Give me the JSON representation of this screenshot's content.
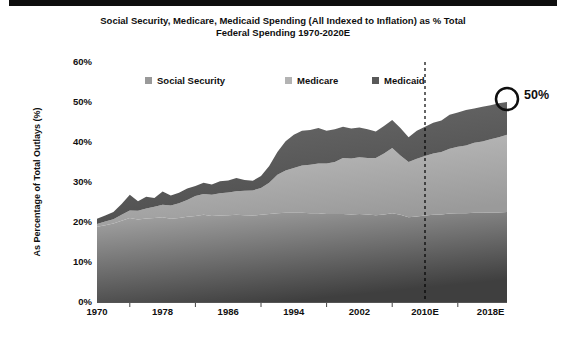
{
  "slide": {
    "title_line1": "Social Security, Medicare, Medicaid Spending (All Indexed to Inflation) as % Total",
    "title_line2": "Federal Spending 1970-2020E"
  },
  "chart_data": {
    "type": "area",
    "stacked": true,
    "title": "Social Security, Medicare, Medicaid Spending (All Indexed to Inflation) as % Total Federal Spending 1970-2020E",
    "xlabel": "",
    "ylabel": "As Percentage of Total Outlays (%)",
    "ylim": [
      0,
      60
    ],
    "grid": false,
    "legend_position": "top",
    "y_ticks": [
      {
        "label": "0%",
        "value": 0
      },
      {
        "label": "10%",
        "value": 10
      },
      {
        "label": "20%",
        "value": 20
      },
      {
        "label": "30%",
        "value": 30
      },
      {
        "label": "40%",
        "value": 40
      },
      {
        "label": "50%",
        "value": 50
      },
      {
        "label": "60%",
        "value": 60
      }
    ],
    "x_ticks": [
      {
        "label": "1970",
        "year": 1970
      },
      {
        "label": "1978",
        "year": 1978
      },
      {
        "label": "1986",
        "year": 1986
      },
      {
        "label": "1994",
        "year": 1994
      },
      {
        "label": "2002",
        "year": 2002
      },
      {
        "label": "2010E",
        "year": 2010
      },
      {
        "label": "2018E",
        "year": 2018
      }
    ],
    "minor_tick_years": [
      1974,
      1982,
      1990,
      1998,
      2006,
      2014
    ],
    "dashed_line_year": 2010,
    "annotation": {
      "label": "50%",
      "year": 2020,
      "value": 50
    },
    "years": [
      1970,
      1971,
      1972,
      1973,
      1974,
      1975,
      1976,
      1977,
      1978,
      1979,
      1980,
      1981,
      1982,
      1983,
      1984,
      1985,
      1986,
      1987,
      1988,
      1989,
      1990,
      1991,
      1992,
      1993,
      1994,
      1995,
      1996,
      1997,
      1998,
      1999,
      2000,
      2001,
      2002,
      2003,
      2004,
      2005,
      2006,
      2007,
      2008,
      2009,
      2010,
      2011,
      2012,
      2013,
      2014,
      2015,
      2016,
      2017,
      2018,
      2019,
      2020
    ],
    "series": [
      {
        "name": "Social Security",
        "legend_color": "#999999",
        "fill_from": "#a8a8a8",
        "fill_to": "#3f3f3f",
        "values": [
          18.8,
          19.2,
          19.6,
          20.3,
          21.0,
          20.6,
          20.9,
          21.0,
          21.2,
          20.8,
          21.0,
          21.3,
          21.5,
          21.8,
          21.5,
          21.6,
          21.7,
          21.8,
          21.7,
          21.6,
          21.8,
          22.0,
          22.2,
          22.3,
          22.3,
          22.3,
          22.2,
          22.2,
          22.0,
          22.0,
          22.0,
          21.9,
          22.0,
          21.9,
          21.7,
          21.9,
          22.2,
          21.8,
          21.2,
          21.4,
          21.6,
          21.8,
          21.9,
          22.1,
          22.2,
          22.2,
          22.3,
          22.3,
          22.4,
          22.4,
          22.5
        ]
      },
      {
        "name": "Medicare",
        "legend_color": "#b3b3b3",
        "fill_from": "#c2c2c2",
        "fill_to": "#9a9a9a",
        "values": [
          0.7,
          0.9,
          1.1,
          1.5,
          1.9,
          2.2,
          2.5,
          2.8,
          3.1,
          3.3,
          3.7,
          4.2,
          5.0,
          5.2,
          5.3,
          5.6,
          5.7,
          5.9,
          6.1,
          6.3,
          6.7,
          7.8,
          9.6,
          10.6,
          11.2,
          11.8,
          12.1,
          12.4,
          12.6,
          13.0,
          14.0,
          14.0,
          14.2,
          14.1,
          14.3,
          15.2,
          16.3,
          14.8,
          13.8,
          14.4,
          14.9,
          15.3,
          15.6,
          16.2,
          16.6,
          16.9,
          17.5,
          17.8,
          18.3,
          18.8,
          19.3
        ]
      },
      {
        "name": "Medicaid",
        "legend_color": "#595959",
        "fill_from": "#6e6e6e",
        "fill_to": "#4c4c4c",
        "values": [
          1.3,
          1.5,
          1.8,
          2.7,
          3.9,
          2.4,
          2.9,
          2.2,
          3.3,
          2.5,
          2.6,
          2.9,
          2.5,
          2.8,
          2.6,
          3.0,
          3.0,
          3.3,
          2.7,
          2.4,
          3.0,
          4.2,
          5.7,
          7.3,
          8.3,
          8.7,
          8.7,
          8.9,
          8.2,
          8.2,
          7.8,
          7.5,
          7.4,
          7.2,
          6.6,
          6.9,
          7.0,
          6.9,
          6.2,
          7.0,
          7.3,
          7.7,
          7.9,
          8.5,
          8.6,
          8.9,
          8.6,
          8.7,
          8.5,
          8.5,
          8.2
        ]
      }
    ]
  }
}
